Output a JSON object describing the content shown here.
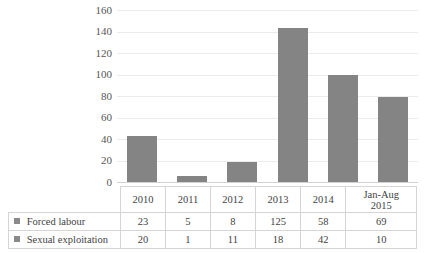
{
  "chart_data": {
    "type": "bar",
    "subtype": "stacked-column-with-data-table",
    "title": "",
    "xlabel": "",
    "ylabel": "",
    "ylim": [
      0,
      160
    ],
    "ytick_step": 20,
    "yticks": [
      "160",
      "140",
      "120",
      "100",
      "80",
      "60",
      "40",
      "20",
      "0"
    ],
    "grid": true,
    "legend_position": "data-table-row-labels",
    "categories": [
      "2010",
      "2011",
      "2012",
      "2013",
      "2014",
      "Jan-Aug 2015"
    ],
    "series": [
      {
        "name": "Forced labour",
        "color": "#848484",
        "values": [
          23,
          5,
          8,
          125,
          58,
          69
        ]
      },
      {
        "name": "Sexual exploitation",
        "color": "#848484",
        "values": [
          20,
          1,
          11,
          18,
          42,
          10
        ]
      }
    ],
    "totals": [
      43,
      6,
      19,
      143,
      100,
      79
    ]
  },
  "axis": {
    "y_tick_labels": [
      "160",
      "140",
      "120",
      "100",
      "80",
      "60",
      "40",
      "20",
      "0"
    ]
  },
  "table": {
    "header": {
      "corner": "",
      "columns": [
        {
          "line1": "2010",
          "line2": ""
        },
        {
          "line1": "2011",
          "line2": ""
        },
        {
          "line1": "2012",
          "line2": ""
        },
        {
          "line1": "2013",
          "line2": ""
        },
        {
          "line1": "2014",
          "line2": ""
        },
        {
          "line1": "Jan-Aug",
          "line2": "2015"
        }
      ]
    },
    "rows": [
      {
        "label": "Forced labour",
        "marker": "legend-square-icon",
        "cells": [
          "23",
          "5",
          "8",
          "125",
          "58",
          "69"
        ]
      },
      {
        "label": "Sexual exploitation",
        "marker": "legend-square-icon",
        "cells": [
          "20",
          "1",
          "11",
          "18",
          "42",
          "10"
        ]
      }
    ]
  },
  "colors": {
    "bar": "#848484",
    "gridline": "#eceaea",
    "axis": "#d3d1d1",
    "table_border": "#d6d4d4",
    "text": "#3f3f3f",
    "tick_text": "#565656"
  }
}
